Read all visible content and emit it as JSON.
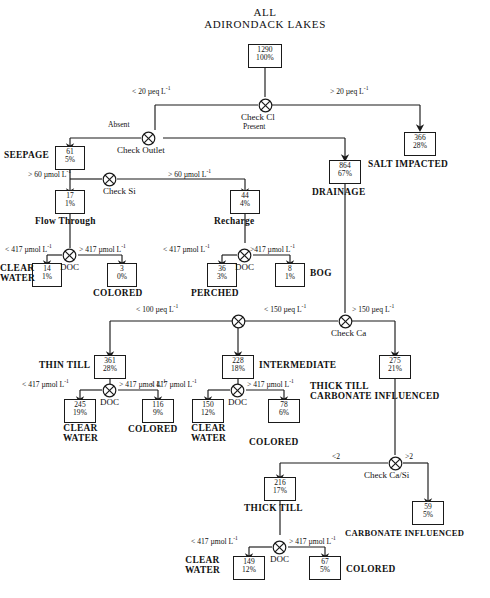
{
  "diagram": {
    "title_line1": "ALL",
    "title_line2": "ADIRONDACK LAKES"
  },
  "nodes": {
    "check_cl": "Check Cl",
    "check_outlet": "Check Outlet",
    "check_si": "Check Si",
    "doc": "DOC",
    "check_ca": "Check Ca",
    "check_ca_si": "Check Ca/Si"
  },
  "boxes": {
    "root": {
      "n": "1290",
      "p": "100%"
    },
    "salt": {
      "n": "366",
      "p": "28%"
    },
    "seepage": {
      "n": "61",
      "p": "5%"
    },
    "drainage": {
      "n": "864",
      "p": "67%"
    },
    "flow_through": {
      "n": "17",
      "p": "1%"
    },
    "recharge": {
      "n": "44",
      "p": "4%"
    },
    "ft_clear": {
      "n": "14",
      "p": "1%"
    },
    "ft_colored": {
      "n": "3",
      "p": "0%"
    },
    "perched": {
      "n": "36",
      "p": "3%"
    },
    "bog": {
      "n": "8",
      "p": "1%"
    },
    "thin_till": {
      "n": "361",
      "p": "28%"
    },
    "intermediate": {
      "n": "228",
      "p": "18%"
    },
    "thick_till_ci": {
      "n": "275",
      "p": "21%"
    },
    "tt_clear": {
      "n": "245",
      "p": "19%"
    },
    "tt_colored": {
      "n": "116",
      "p": "9%"
    },
    "int_clear": {
      "n": "150",
      "p": "12%"
    },
    "int_colored": {
      "n": "78",
      "p": "6%"
    },
    "thick_till": {
      "n": "216",
      "p": "17%"
    },
    "carbonate": {
      "n": "59",
      "p": "5%"
    },
    "tt2_clear": {
      "n": "149",
      "p": "12%"
    },
    "tt2_colored": {
      "n": "67",
      "p": "5%"
    }
  },
  "categories": {
    "salt_impacted": "SALT IMPACTED",
    "seepage": "SEEPAGE",
    "drainage": "DRAINAGE",
    "flow_through": "Flow Through",
    "recharge": "Recharge",
    "clear_water_1a": "CLEAR",
    "clear_water_1b": "WATER",
    "colored_1": "COLORED",
    "perched": "PERCHED",
    "bog": "BOG",
    "thin_till": "THIN TILL",
    "intermediate": "INTERMEDIATE",
    "thick_till_carbonate_1": "THICK TILL",
    "thick_till_carbonate_2": "CARBONATE INFLUENCED",
    "clear_water_2a": "CLEAR",
    "clear_water_2b": "WATER",
    "colored_2": "COLORED",
    "clear_water_3a": "CLEAR",
    "clear_water_3b": "WATER",
    "colored_3": "COLORED",
    "thick_till": "THICK TILL",
    "carbonate_influenced": "CARBONATE INFLUENCED",
    "clear_water_4a": "CLEAR",
    "clear_water_4b": "WATER",
    "colored_4": "COLORED"
  },
  "conditions": {
    "cl_lt": {
      "pre": "< 20 µeq L",
      "sup": "-1"
    },
    "cl_gt": {
      "pre": "> 20 µeq L",
      "sup": "-1"
    },
    "outlet_absent": {
      "pre": "Absent",
      "sup": ""
    },
    "outlet_present": {
      "pre": "Present",
      "sup": ""
    },
    "si_left": {
      "pre": "> 60 µmol L",
      "sup": "-1"
    },
    "si_right": {
      "pre": "> 60 µmol L",
      "sup": "-1"
    },
    "doc1_lt": {
      "pre": "< 417 µmol L",
      "sup": "-1"
    },
    "doc1_gt": {
      "pre": "> 417 µmol L",
      "sup": "-1"
    },
    "doc2_lt": {
      "pre": "< 417 µmol L",
      "sup": "-1"
    },
    "doc2_gt": {
      "pre": ">417   µmol L",
      "sup": "-1"
    },
    "ca_lt100": {
      "pre": "< 100 µeq L",
      "sup": "-1"
    },
    "ca_lt150": {
      "pre": "< 150 µeq L",
      "sup": "-1"
    },
    "ca_gt150": {
      "pre": "> 150 µeq L",
      "sup": "-1"
    },
    "doc3_lt": {
      "pre": "< 417 µmol L",
      "sup": "-1"
    },
    "doc3_gt": {
      "pre": "> 417 µmol L",
      "sup": "-1"
    },
    "doc4_lt": {
      "pre": "< 417 µmol L",
      "sup": "-1"
    },
    "doc4_gt": {
      "pre": "> 417 µmol L",
      "sup": "-1"
    },
    "casi_lt": {
      "pre": "<2",
      "sup": ""
    },
    "casi_gt": {
      "pre": ">2",
      "sup": ""
    },
    "doc5_lt": {
      "pre": "< 417 µmol L",
      "sup": "-1"
    },
    "doc5_gt": {
      "pre": "> 417 µmol L",
      "sup": "-1"
    }
  },
  "colors": {
    "stroke": "#1a1a1a",
    "background": "#ffffff"
  }
}
